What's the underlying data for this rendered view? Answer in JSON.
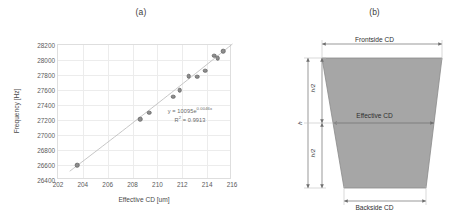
{
  "panels": {
    "a": {
      "label": "(a)"
    },
    "b": {
      "label": "(b)"
    }
  },
  "chart_data": {
    "type": "scatter",
    "title": "",
    "xlabel": "Effective CD [um]",
    "ylabel": "Frequency [Hz]",
    "xlim": [
      202,
      216
    ],
    "ylim": [
      26400,
      28200
    ],
    "xticks": [
      "202",
      "204",
      "206",
      "208",
      "210",
      "212",
      "214",
      "216"
    ],
    "yticks": [
      "26400",
      "26600",
      "26800",
      "27000",
      "27200",
      "27400",
      "27600",
      "27800",
      "28000",
      "28200"
    ],
    "grid": true,
    "legend": "none",
    "marker_color": "#8e8e8e",
    "trendline": {
      "type": "exponential",
      "color": "#b9b9b9"
    },
    "annotations": {
      "equation": "y = 10095e",
      "equation_exponent": "0.0046x",
      "r_squared_label": "R",
      "r_squared_sup": "2",
      "r_squared_value": " = 0.9913"
    },
    "points": [
      {
        "x": 203.55,
        "y": 26595
      },
      {
        "x": 208.62,
        "y": 27210
      },
      {
        "x": 209.35,
        "y": 27295
      },
      {
        "x": 211.25,
        "y": 27510
      },
      {
        "x": 211.8,
        "y": 27595
      },
      {
        "x": 212.5,
        "y": 27785
      },
      {
        "x": 213.2,
        "y": 27780
      },
      {
        "x": 213.85,
        "y": 27860
      },
      {
        "x": 214.55,
        "y": 28060
      },
      {
        "x": 214.85,
        "y": 28025
      },
      {
        "x": 215.3,
        "y": 28120
      }
    ]
  },
  "diagram": {
    "shape": "trapezoid-cross-section",
    "fill_color": "#a6a6a6",
    "labels": {
      "frontside": "Frontside CD",
      "effective": "Effective CD",
      "backside": "Backside CD",
      "half_height_top": "h/2",
      "half_height_bottom": "h/2",
      "height": "h"
    }
  }
}
